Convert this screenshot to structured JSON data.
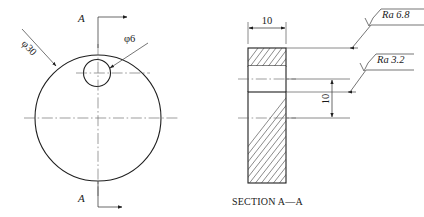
{
  "drawing": {
    "title": "Engineering part drawing - front view and section",
    "front_view": {
      "outer_diameter_label": "φ30",
      "hole_diameter_label": "φ6",
      "section_cut_label_top": "A",
      "section_cut_label_bottom": "A",
      "arrow_direction": "right"
    },
    "section_view": {
      "caption": "SECTION A—A",
      "width_dimension": "10",
      "height_dimension": "10",
      "surface_finish": [
        {
          "id": "ra-upper",
          "prefix": "Ra",
          "value": "6.8",
          "text": "Ra 6.8"
        },
        {
          "id": "ra-lower",
          "prefix": "Ra",
          "value": "3.2",
          "text": "Ra 3.2"
        }
      ]
    },
    "colors": {
      "outline": "#1f1f1f",
      "thin": "#4a4a4a",
      "centerline": "#5a5a5a",
      "hatch": "#3a3a3a",
      "background": "#ffffff"
    }
  }
}
